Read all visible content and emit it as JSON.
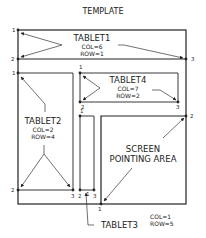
{
  "title": "TEMPLATE",
  "tablets": [
    {
      "id": "tablet1",
      "name": "TABLET1",
      "col": "COL=6",
      "row": "ROW=1",
      "points": [
        "1",
        "2",
        "3"
      ]
    },
    {
      "id": "tablet2",
      "name": "TABLET2",
      "col": "COL=2",
      "row": "ROW=4",
      "points": [
        "1",
        "2",
        "3"
      ]
    },
    {
      "id": "tablet3",
      "name": "TABLET3",
      "col": "COL=1",
      "row": "ROW=5",
      "points": [
        "1",
        "2",
        "3"
      ]
    },
    {
      "id": "tablet4",
      "name": "TABLET4",
      "col": "COL=7",
      "row": "ROW=2",
      "points": [
        "1",
        "2",
        "3"
      ]
    }
  ],
  "screen_area": {
    "line1": "SCREEN",
    "line2": "POINTING AREA",
    "points": [
      "1",
      "2"
    ]
  },
  "colors": {
    "ink": "#222222",
    "background": "#ffffff"
  }
}
